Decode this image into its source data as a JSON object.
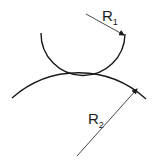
{
  "diagram": {
    "labels": {
      "r1": {
        "main": "R",
        "sub": "1"
      },
      "r2": {
        "main": "R",
        "sub": "2"
      }
    },
    "colors": {
      "stroke": "#1a1a1a",
      "background": "#ffffff"
    }
  }
}
